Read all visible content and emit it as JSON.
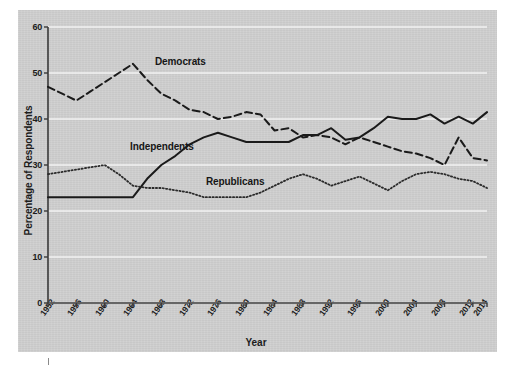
{
  "chart_data": {
    "type": "line",
    "title": "",
    "xlabel": "Year",
    "ylabel": "Percentage of Respondents",
    "xlim": [
      1952,
      2014
    ],
    "ylim": [
      0,
      60
    ],
    "yticks": [
      0,
      10,
      20,
      30,
      40,
      50,
      60
    ],
    "grid": true,
    "legend_position": "inline-annotations",
    "categories": [
      1952,
      1954,
      1956,
      1958,
      1960,
      1962,
      1964,
      1966,
      1968,
      1970,
      1972,
      1974,
      1976,
      1978,
      1980,
      1982,
      1984,
      1986,
      1988,
      1990,
      1992,
      1994,
      1996,
      1998,
      2000,
      2002,
      2004,
      2006,
      2008,
      2010,
      2012,
      2014
    ],
    "xtick_labels": [
      "1952",
      "1956",
      "1960",
      "1964",
      "1968",
      "1972",
      "1976",
      "1980",
      "1984",
      "1988",
      "1992",
      "1996",
      "2000",
      "2004",
      "2008",
      "2012",
      "2014"
    ],
    "xtick_values": [
      1952,
      1956,
      1960,
      1964,
      1968,
      1972,
      1976,
      1980,
      1984,
      1988,
      1992,
      1996,
      2000,
      2004,
      2008,
      2012,
      2014
    ],
    "series": [
      {
        "name": "Democrats",
        "style": "dashed",
        "color": "#1a1a1a",
        "values": [
          47.0,
          45.5,
          44.0,
          46.0,
          48.0,
          50.0,
          52.0,
          48.5,
          45.5,
          44.0,
          42.0,
          41.5,
          40.0,
          40.5,
          41.5,
          41.0,
          37.5,
          38.0,
          36.0,
          36.5,
          36.0,
          34.5,
          36.0,
          35.0,
          34.0,
          33.0,
          32.5,
          31.5,
          30.0,
          36.0,
          31.5,
          31.0
        ]
      },
      {
        "name": "Independents",
        "style": "solid",
        "color": "#1a1a1a",
        "values": [
          23.0,
          23.0,
          23.0,
          23.0,
          23.0,
          23.0,
          23.0,
          27.0,
          30.0,
          32.0,
          34.5,
          36.0,
          37.0,
          36.0,
          35.0,
          35.0,
          35.0,
          35.0,
          36.5,
          36.5,
          38.0,
          35.5,
          36.0,
          38.0,
          40.5,
          40.0,
          40.0,
          41.0,
          39.0,
          40.5,
          39.0,
          41.5
        ]
      },
      {
        "name": "Republicans",
        "style": "dotted",
        "color": "#2a2a2a",
        "values": [
          28.0,
          28.5,
          29.0,
          29.5,
          30.0,
          28.0,
          25.5,
          25.0,
          25.0,
          24.5,
          24.0,
          23.0,
          23.0,
          23.0,
          23.0,
          24.0,
          25.5,
          27.0,
          28.0,
          27.0,
          25.5,
          26.5,
          27.5,
          26.0,
          24.5,
          26.5,
          28.0,
          28.5,
          28.0,
          27.0,
          26.5,
          25.0
        ]
      }
    ],
    "annotations": [
      {
        "label": "Democrats",
        "x_px": 155,
        "y_px": 58
      },
      {
        "label": "Independents",
        "x_px": 130,
        "y_px": 143
      },
      {
        "label": "Republicans",
        "x_px": 208,
        "y_px": 178
      }
    ]
  },
  "colors": {
    "panel_background": "#cfcfcf",
    "gridline": "#f2f2f2",
    "axis": "#3a3a3a",
    "text": "#1c1c1c"
  }
}
